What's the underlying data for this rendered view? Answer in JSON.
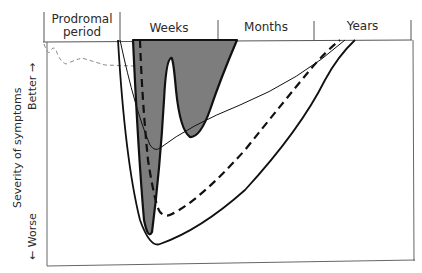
{
  "diagram": {
    "phases": [
      {
        "label": "Prodromal\nperiod",
        "line1": "Prodromal",
        "line2": "period"
      },
      {
        "label": "Weeks"
      },
      {
        "label": "Months"
      },
      {
        "label": "Years"
      }
    ],
    "y_axis": {
      "title": "Severity of symptoms",
      "better": "Better →",
      "worse": "← Worse"
    },
    "colors": {
      "line": "#111111",
      "fill": "#7a7a7a",
      "frame": "#555555",
      "prodromal_dash": "#888888"
    },
    "curves": [
      {
        "name": "prodromal-fluctuation",
        "style": "thin-dashed-gray"
      },
      {
        "name": "shaded-recurrent-course",
        "style": "gray-filled-thick-outline"
      },
      {
        "name": "thick-dashed-course",
        "style": "thick-dashed"
      },
      {
        "name": "thin-course",
        "style": "thin-solid"
      },
      {
        "name": "wide-outer-course",
        "style": "thick-solid"
      }
    ]
  }
}
